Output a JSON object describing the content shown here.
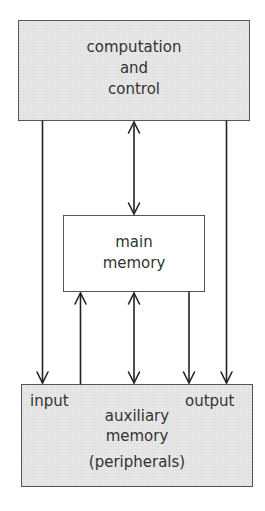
{
  "diagram": {
    "type": "block-diagram",
    "nodes": {
      "computation": {
        "lines": [
          "computation",
          "and",
          "control"
        ]
      },
      "main_memory": {
        "lines": [
          "main",
          "memory"
        ]
      },
      "auxiliary": {
        "input_label": "input",
        "output_label": "output",
        "lines": [
          "auxiliary",
          "memory",
          "(peripherals)"
        ]
      }
    },
    "edges": [
      {
        "from": "computation",
        "to": "auxiliary.input",
        "direction": "down"
      },
      {
        "from": "computation",
        "to": "main_memory",
        "direction": "bidirectional"
      },
      {
        "from": "computation",
        "to": "auxiliary.output",
        "direction": "down"
      },
      {
        "from": "auxiliary.input",
        "to": "main_memory",
        "direction": "up"
      },
      {
        "from": "auxiliary",
        "to": "main_memory",
        "direction": "bidirectional"
      },
      {
        "from": "main_memory",
        "to": "auxiliary.output",
        "direction": "down"
      }
    ],
    "colors": {
      "box_fill": "#e6e6e6",
      "stroke": "#222222",
      "text": "#333333"
    }
  }
}
